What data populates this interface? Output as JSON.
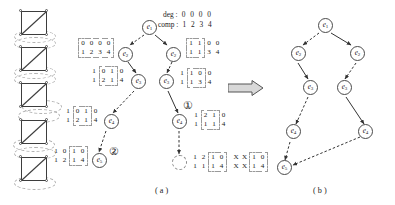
{
  "figure": {
    "panels": [
      {
        "id": "a",
        "caption": "( a )"
      },
      {
        "id": "b",
        "caption": "( b )"
      }
    ],
    "transform_arrow_icon": "right-arrow-icon"
  },
  "legend": {
    "deg_label": "deg :",
    "deg_values": [
      "0",
      "0",
      "0",
      "0"
    ],
    "comp_label": "comp :",
    "comp_values": [
      "1",
      "2",
      "3",
      "4"
    ]
  },
  "graphs": [
    {
      "name": "graph-1"
    },
    {
      "name": "graph-2"
    },
    {
      "name": "graph-3"
    },
    {
      "name": "graph-4"
    },
    {
      "name": "graph-5"
    }
  ],
  "panel_a": {
    "nodes": [
      {
        "id": "a-e1",
        "label": "e",
        "sub": "1",
        "x": 142,
        "y": 20,
        "dashed": false
      },
      {
        "id": "a-e2-left",
        "label": "e",
        "sub": "2",
        "x": 118,
        "y": 47,
        "dashed": false
      },
      {
        "id": "a-e2-right",
        "label": "e",
        "sub": "2",
        "x": 166,
        "y": 47,
        "dashed": false
      },
      {
        "id": "a-e3-left",
        "label": "e",
        "sub": "3",
        "x": 131,
        "y": 76,
        "dashed": false
      },
      {
        "id": "a-e3-right",
        "label": "e",
        "sub": "3",
        "x": 159,
        "y": 76,
        "dashed": false
      },
      {
        "id": "a-e4-left",
        "label": "e",
        "sub": "4",
        "x": 104,
        "y": 116,
        "dashed": false
      },
      {
        "id": "a-e4-right",
        "label": "e",
        "sub": "4",
        "x": 172,
        "y": 116,
        "dashed": false
      },
      {
        "id": "a-e5-left",
        "label": "e",
        "sub": "5",
        "x": 92,
        "y": 155,
        "dashed": false
      },
      {
        "id": "a-e6-right",
        "label": "",
        "sub": "",
        "x": 172,
        "y": 157,
        "dashed": true
      }
    ],
    "matrices": [
      {
        "name": "matrix-e2-left",
        "top": [
          "0",
          "0",
          "0",
          "0"
        ],
        "bottom": [
          "1",
          "2",
          "3",
          "4"
        ],
        "boxed": [
          0,
          1,
          2,
          3
        ]
      },
      {
        "name": "matrix-e3-left",
        "top": [
          "1",
          "0",
          "1",
          "0"
        ],
        "bottom": [
          "1",
          "2",
          "1",
          "4"
        ],
        "boxed": [
          1,
          2
        ]
      },
      {
        "name": "matrix-e4-left",
        "top": [
          "1",
          "0",
          "1",
          "0"
        ],
        "bottom": [
          "1",
          "2",
          "1",
          "4"
        ],
        "boxed": [
          1,
          2
        ]
      },
      {
        "name": "matrix-e5-left",
        "top": [
          "1",
          "0",
          "1",
          "0"
        ],
        "bottom": [
          "1",
          "2",
          "1",
          "4"
        ],
        "boxed": [
          2,
          3
        ]
      },
      {
        "name": "matrix-e2-right",
        "top": [
          "1",
          "1",
          "0",
          "0"
        ],
        "bottom": [
          "1",
          "1",
          "3",
          "4"
        ],
        "boxed": [
          0,
          1
        ]
      },
      {
        "name": "matrix-e3-right",
        "top": [
          "1",
          "1",
          "0",
          "0"
        ],
        "bottom": [
          "1",
          "1",
          "3",
          "4"
        ],
        "boxed": [
          1,
          2
        ]
      },
      {
        "name": "matrix-e4-right",
        "top": [
          "1",
          "2",
          "1",
          "0"
        ],
        "bottom": [
          "1",
          "1",
          "1",
          "4"
        ],
        "boxed": [
          1,
          2
        ]
      },
      {
        "name": "matrix-e6-right",
        "top": [
          "1",
          "2",
          "1",
          "0"
        ],
        "bottom": [
          "1",
          "1",
          "1",
          "4"
        ],
        "boxed": [
          2,
          3
        ]
      },
      {
        "name": "matrix-e6-right-xx",
        "top": [
          "X",
          "X",
          "1",
          "0"
        ],
        "bottom": [
          "X",
          "X",
          "1",
          "4"
        ],
        "boxed": [
          2,
          3
        ]
      }
    ],
    "markers": [
      {
        "name": "marker-one",
        "value": "①"
      },
      {
        "name": "marker-two",
        "value": "②"
      }
    ]
  },
  "panel_b": {
    "nodes": [
      {
        "id": "b-e1",
        "label": "e",
        "sub": "1",
        "x": 318,
        "y": 18
      },
      {
        "id": "b-e2-left",
        "label": "e",
        "sub": "2",
        "x": 291,
        "y": 48
      },
      {
        "id": "b-e2-right",
        "label": "e",
        "sub": "2",
        "x": 350,
        "y": 48
      },
      {
        "id": "b-e3-left",
        "label": "e",
        "sub": "3",
        "x": 305,
        "y": 82
      },
      {
        "id": "b-e3-right",
        "label": "e",
        "sub": "3",
        "x": 336,
        "y": 82
      },
      {
        "id": "b-e4-left",
        "label": "e",
        "sub": "4",
        "x": 286,
        "y": 127
      },
      {
        "id": "b-e4-right",
        "label": "e",
        "sub": "4",
        "x": 361,
        "y": 127
      },
      {
        "id": "b-e5",
        "label": "e",
        "sub": "5",
        "x": 277,
        "y": 163
      }
    ]
  }
}
